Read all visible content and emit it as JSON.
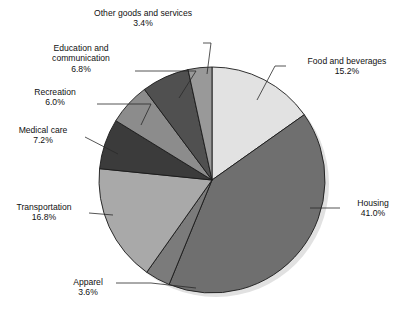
{
  "chart_data": {
    "type": "pie",
    "title": "",
    "subtitle": "",
    "xlabel": "",
    "ylabel": "",
    "legend_position": "none",
    "grid": false,
    "units": "percent",
    "start_angle_deg": 0,
    "direction": "clockwise",
    "categories": [
      "Food and beverages",
      "Housing",
      "Apparel",
      "Transportation",
      "Medical care",
      "Recreation",
      "Education and communication",
      "Other goods and services"
    ],
    "values": [
      15.2,
      41.0,
      3.6,
      16.8,
      7.2,
      6.0,
      6.8,
      3.4
    ],
    "value_labels": [
      "15.2%",
      "41.0%",
      "3.6%",
      "16.8%",
      "7.2%",
      "6.0%",
      "6.8%",
      "3.4%"
    ],
    "colors": [
      "#e2e2e2",
      "#6f6f6f",
      "#7b7b7b",
      "#a9a9a9",
      "#3b3b3b",
      "#8c8c8c",
      "#505050",
      "#999999"
    ],
    "slice_edge_color": "#1a1a1a",
    "total": 100.0
  },
  "labels": [
    {
      "key": "other-goods-and-services",
      "name": "Other goods and services",
      "pct": "3.4%",
      "line1": "Other goods and services",
      "line2": "3.4%"
    },
    {
      "key": "education-and-communication",
      "name": "Education and communication",
      "pct": "6.8%",
      "line1": "Education and",
      "line2": "communication",
      "line3": "6.8%"
    },
    {
      "key": "recreation",
      "name": "Recreation",
      "pct": "6.0%",
      "line1": "Recreation",
      "line2": "6.0%"
    },
    {
      "key": "medical-care",
      "name": "Medical care",
      "pct": "7.2%",
      "line1": "Medical care",
      "line2": "7.2%"
    },
    {
      "key": "transportation",
      "name": "Transportation",
      "pct": "16.8%",
      "line1": "Transportation",
      "line2": "16.8%"
    },
    {
      "key": "apparel",
      "name": "Apparel",
      "pct": "3.6%",
      "line1": "Apparel",
      "line2": "3.6%"
    },
    {
      "key": "food-and-beverages",
      "name": "Food and beverages",
      "pct": "15.2%",
      "line1": "Food and beverages",
      "line2": "15.2%"
    },
    {
      "key": "housing",
      "name": "Housing",
      "pct": "41.0%",
      "line1": "Housing",
      "line2": "41.0%"
    }
  ]
}
